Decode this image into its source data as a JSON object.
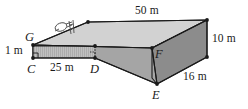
{
  "figure": {
    "colors": {
      "outline": "#1a1a1a",
      "top_face": "#d2d2d2",
      "front_face": "#9a9a9a",
      "side_face": "#8a8a8a",
      "hatch_band": "#b4b4b4",
      "background": "#ffffff",
      "sketch": "#555555"
    },
    "dimensions": [
      {
        "id": "top-length",
        "value": "50 m"
      },
      {
        "id": "base-length",
        "value": "25 m"
      },
      {
        "id": "height-small",
        "value": "1 m"
      },
      {
        "id": "height-right",
        "value": "10 m"
      },
      {
        "id": "depth-right",
        "value": "16 m"
      }
    ],
    "vertices": [
      {
        "id": "vertex-g",
        "label": "G"
      },
      {
        "id": "vertex-c",
        "label": "C"
      },
      {
        "id": "vertex-d",
        "label": "D"
      },
      {
        "id": "vertex-e",
        "label": "E"
      },
      {
        "id": "vertex-f",
        "label": "F"
      }
    ],
    "icons": {
      "person_sketch": "person-on-ramp-sketch",
      "right_angle_marker": "right-angle-icon",
      "dashed_edge": "hidden-edge-icon"
    }
  }
}
